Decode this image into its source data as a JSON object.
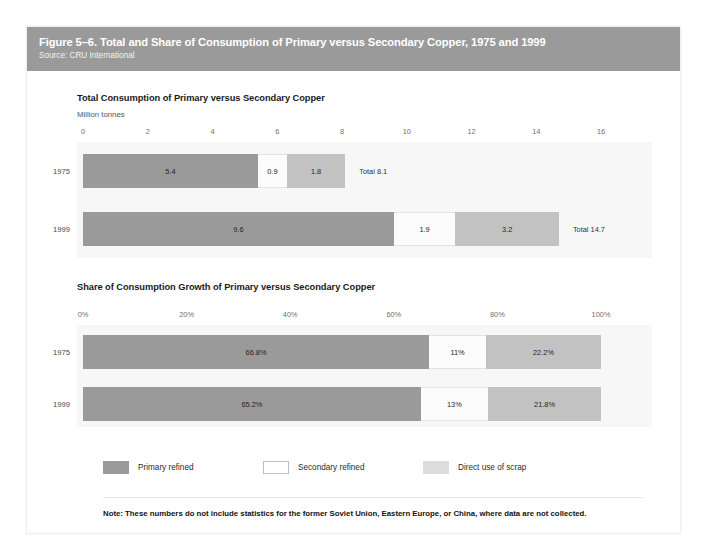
{
  "figure": {
    "title": "Figure 5–6. Total and Share of Consumption of Primary versus Secondary Copper, 1975 and 1999",
    "source": "Source: CRU International",
    "note": "Note: These numbers do not include statistics for the former Soviet Union, Eastern Europe, or China, where data are not collected.",
    "header_color": "#9a9a9a"
  },
  "legend": {
    "items": [
      {
        "label": "Primary refined",
        "color": "#9a9a9a"
      },
      {
        "label": "Secondary refined",
        "color": "#ffffff"
      },
      {
        "label": "Direct use of scrap",
        "color": "#dcdcdc"
      }
    ]
  },
  "chart_data": [
    {
      "type": "bar",
      "orientation": "horizontal",
      "stacked": true,
      "title": "Total Consumption of Primary versus Secondary Copper",
      "subtitle": "Million tonnes",
      "ylabel": "",
      "xlabel": "Million tonnes",
      "xlim": [
        0,
        16
      ],
      "ticks": [
        "0",
        "2",
        "4",
        "6",
        "8",
        "10",
        "12",
        "14",
        "16"
      ],
      "tick_values": [
        0,
        2,
        4,
        6,
        8,
        10,
        12,
        14,
        16
      ],
      "grid": false,
      "legend_position": "bottom",
      "categories": [
        "1975",
        "1999"
      ],
      "series": [
        {
          "name": "Primary refined",
          "values": [
            5.4,
            9.6
          ],
          "labels": [
            "5.4",
            "9.6"
          ],
          "color": "#9a9a9a"
        },
        {
          "name": "Secondary refined",
          "values": [
            0.9,
            1.9
          ],
          "labels": [
            "0.9",
            "1.9"
          ],
          "color": "#fcfcfc"
        },
        {
          "name": "Direct use of scrap",
          "values": [
            1.8,
            3.2
          ],
          "labels": [
            "1.8",
            "3.2"
          ],
          "color": "#c2c2c2"
        }
      ],
      "totals": [
        "Total 8.1",
        "Total 14.7"
      ],
      "total_values": [
        8.1,
        14.7
      ]
    },
    {
      "type": "bar",
      "orientation": "horizontal",
      "stacked": true,
      "title": "Share of Consumption Growth of Primary versus Secondary Copper",
      "subtitle": "",
      "ylabel": "",
      "xlabel": "",
      "xlim": [
        0,
        100
      ],
      "ticks": [
        "0%",
        "20%",
        "40%",
        "60%",
        "80%",
        "100%"
      ],
      "tick_values": [
        0,
        20,
        40,
        60,
        80,
        100
      ],
      "grid": false,
      "legend_position": "bottom",
      "categories": [
        "1975",
        "1999"
      ],
      "series": [
        {
          "name": "Primary refined",
          "values": [
            66.8,
            65.2
          ],
          "labels": [
            "66.8%",
            "65.2%"
          ],
          "color": "#9a9a9a"
        },
        {
          "name": "Secondary refined",
          "values": [
            11.0,
            13.0
          ],
          "labels": [
            "11%",
            "13%"
          ],
          "color": "#fcfcfc"
        },
        {
          "name": "Direct use of scrap",
          "values": [
            22.2,
            21.8
          ],
          "labels": [
            "22.2%",
            "21.8%"
          ],
          "color": "#c2c2c2"
        }
      ],
      "totals": [
        "",
        ""
      ],
      "total_values": [
        100,
        100
      ]
    }
  ]
}
